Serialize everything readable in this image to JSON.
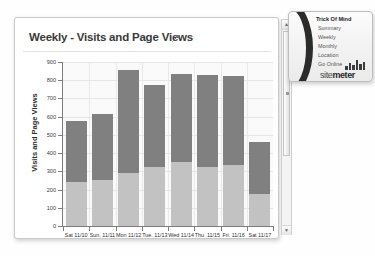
{
  "card": {
    "title": "Weekly - Visits and Page Views",
    "expand_icon": "diagonal-arrow-icon"
  },
  "scrollbar": {
    "up_arrow": "▲",
    "down_arrow": "▼"
  },
  "panel": {
    "title": "Trick Of Mind",
    "links": [
      "Summary",
      "Weekly",
      "Monthly",
      "Location",
      "Go Online"
    ],
    "logo_text_light": "site",
    "logo_text_bold": "meter",
    "logo_icon": "bar-chart-logo-icon"
  },
  "chart_data": {
    "type": "bar",
    "title": "Weekly - Visits and Page Views",
    "xlabel": "",
    "ylabel": "Visits and Page Views",
    "ylim": [
      0,
      900
    ],
    "yticks": [
      0,
      100,
      200,
      300,
      400,
      500,
      600,
      700,
      800,
      900
    ],
    "grid": true,
    "legend": "none",
    "stacked": true,
    "categories": [
      "Sat 11/10",
      "Sun. 11/11",
      "Mon 11/12",
      "Tue. 11/13",
      "Wed  11/14",
      "Thu. 11/15",
      "Fri. 11/16",
      "Sat 11/17"
    ],
    "series": [
      {
        "name": "Visits",
        "color": "#c2c2c2",
        "values": [
          240,
          255,
          290,
          325,
          350,
          325,
          335,
          175
        ]
      },
      {
        "name": "Page Views",
        "color": "#808080",
        "values": [
          335,
          360,
          565,
          450,
          485,
          505,
          490,
          285
        ]
      }
    ],
    "totals": [
      575,
      615,
      855,
      775,
      835,
      830,
      825,
      460
    ]
  }
}
